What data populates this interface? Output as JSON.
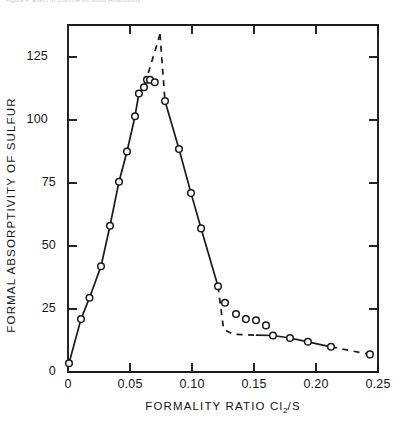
{
  "top_caption": "Figure 4. Effect of Chlorine on Sulfur Absorptivity",
  "chart_data": {
    "type": "scatter",
    "title": "",
    "xlabel": "FORMALITY RATIO Cl2/S",
    "xlabel_base": "FORMALITY RATIO Cl",
    "xlabel_sub": "2",
    "xlabel_tail": "/S",
    "ylabel": "FORMAL ABSORPTIVITY OF SULFUR",
    "xlim": [
      0,
      0.25
    ],
    "ylim": [
      0,
      137.7
    ],
    "grid": false,
    "legend": null,
    "xticks": [
      0,
      0.05,
      0.1,
      0.15,
      0.2,
      0.25
    ],
    "xtick_labels": [
      "0",
      "0.05",
      "0.10",
      "0.15",
      "0.20",
      "0.25"
    ],
    "yticks": [
      0,
      25,
      50,
      75,
      100,
      125
    ],
    "ytick_labels": [
      "0",
      "25",
      "50",
      "75",
      "100",
      "125"
    ],
    "marker": "open-circle",
    "points": [
      {
        "x": 0.0008,
        "y": 3.5
      },
      {
        "x": 0.0105,
        "y": 21.0
      },
      {
        "x": 0.0173,
        "y": 29.5
      },
      {
        "x": 0.0266,
        "y": 42.0
      },
      {
        "x": 0.0339,
        "y": 58.0
      },
      {
        "x": 0.0411,
        "y": 75.5
      },
      {
        "x": 0.0476,
        "y": 87.5
      },
      {
        "x": 0.054,
        "y": 101.5
      },
      {
        "x": 0.0572,
        "y": 110.5
      },
      {
        "x": 0.0613,
        "y": 113.0
      },
      {
        "x": 0.0637,
        "y": 116.0
      },
      {
        "x": 0.0661,
        "y": 116.0
      },
      {
        "x": 0.07,
        "y": 115.0
      },
      {
        "x": 0.0782,
        "y": 107.5
      },
      {
        "x": 0.0895,
        "y": 88.5
      },
      {
        "x": 0.0992,
        "y": 71.0
      },
      {
        "x": 0.1073,
        "y": 57.0
      },
      {
        "x": 0.121,
        "y": 34.0
      },
      {
        "x": 0.1266,
        "y": 27.5
      },
      {
        "x": 0.1355,
        "y": 23.0
      },
      {
        "x": 0.1435,
        "y": 21.0
      },
      {
        "x": 0.1516,
        "y": 20.5
      },
      {
        "x": 0.1597,
        "y": 18.5
      },
      {
        "x": 0.1653,
        "y": 14.5
      },
      {
        "x": 0.179,
        "y": 13.5
      },
      {
        "x": 0.1935,
        "y": 12.0
      },
      {
        "x": 0.2121,
        "y": 10.0
      },
      {
        "x": 0.2435,
        "y": 7.0
      }
    ],
    "peak": {
      "x": 0.0742,
      "y": 134.0
    },
    "annotations": [
      {
        "kind": "solid-line",
        "description": "rising branch through points from origin to ~0.057"
      },
      {
        "kind": "dashed-line",
        "description": "extrapolated peak apex near ratio 0.074"
      },
      {
        "kind": "solid-line",
        "description": "descending branch ~0.078 to ~0.107"
      },
      {
        "kind": "dashed-line",
        "description": "dashed baseline through tail region"
      },
      {
        "kind": "scatter-cluster",
        "description": "cluster of points above dashed baseline between 0.126 and 0.165"
      }
    ]
  }
}
